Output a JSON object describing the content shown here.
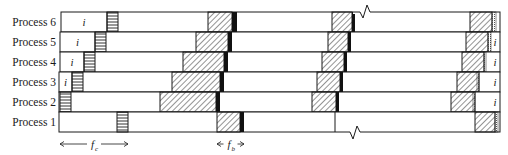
{
  "diagram": {
    "type": "process timeline (checkpoint / ladder diagram)",
    "rows": [
      {
        "label": "Process 6",
        "y": 12,
        "start": 61,
        "init_label": "i",
        "init_end": 107,
        "ladder": [
          107,
          118
        ],
        "phases": [
          {
            "hatch": [
              208,
              232
            ],
            "black": [
              232,
              237
            ]
          },
          {
            "hatch": [
              332,
              352
            ],
            "black": [
              352,
              355
            ]
          },
          {
            "hatch": [
              470,
              492
            ],
            "dotted": [
              492,
              496
            ]
          }
        ],
        "end": 500,
        "break_mark_top": 365,
        "tail_label": ""
      },
      {
        "label": "Process 5",
        "y": 32,
        "start": 60,
        "init_label": "i",
        "init_end": 95,
        "ladder": [
          95,
          106
        ],
        "phases": [
          {
            "hatch": [
              196,
              228
            ],
            "black": [
              228,
              232
            ]
          },
          {
            "hatch": [
              328,
              348
            ],
            "black": [
              348,
              351
            ]
          },
          {
            "hatch": [
              466,
              488
            ],
            "dotted": [
              488,
              491
            ]
          }
        ],
        "end": 500,
        "tail_label": "i"
      },
      {
        "label": "Process 4",
        "y": 52,
        "start": 60,
        "init_label": "i",
        "init_end": 84,
        "ladder": [
          84,
          95
        ],
        "phases": [
          {
            "hatch": [
              183,
              224
            ],
            "black": [
              224,
              228
            ]
          },
          {
            "hatch": [
              322,
              344
            ],
            "black": [
              344,
              347
            ]
          },
          {
            "hatch": [
              462,
              484
            ],
            "dotted": [
              484,
              486
            ]
          }
        ],
        "end": 500,
        "tail_label": "i"
      },
      {
        "label": "Process 3",
        "y": 72,
        "start": 59,
        "init_label": "i",
        "init_end": 72,
        "ladder": [
          72,
          83
        ],
        "phases": [
          {
            "hatch": [
              172,
              220
            ],
            "black": [
              220,
              224
            ]
          },
          {
            "hatch": [
              317,
              340
            ],
            "black": [
              340,
              343
            ]
          },
          {
            "hatch": [
              457,
              479
            ],
            "dotted": [
              477,
              479
            ]
          }
        ],
        "end": 500,
        "tail_label": "i"
      },
      {
        "label": "Process 2",
        "y": 92,
        "start": 59,
        "init_label": "",
        "init_end": 60,
        "ladder": [
          60,
          71
        ],
        "phases": [
          {
            "hatch": [
              160,
              216
            ],
            "black": [
              216,
              220
            ]
          },
          {
            "hatch": [
              312,
              336
            ],
            "black": [
              336,
              339
            ]
          },
          {
            "hatch": [
              451,
              475
            ],
            "dotted": [
              473,
              475
            ]
          }
        ],
        "end": 500,
        "tail_label": "i"
      },
      {
        "label": "Process 1",
        "y": 112,
        "start": 59,
        "init_label": "",
        "init_end": 59,
        "ladder": [
          117,
          128
        ],
        "phases": [
          {
            "hatch": [
              217,
              240
            ],
            "black": [
              240,
              244
            ]
          },
          {
            "divider": 335
          },
          {
            "hatch": [
              475,
              495
            ],
            "dotted": [
              495,
              498
            ]
          }
        ],
        "end": 500,
        "break_mark_bottom": 355,
        "tail_label": ""
      }
    ],
    "row_height": 20,
    "annotations": [
      {
        "symbol": "f",
        "subscript": "c",
        "x1": 60,
        "x2": 128,
        "y": 144
      },
      {
        "symbol": "f",
        "subscript": "b",
        "x1": 217,
        "x2": 244,
        "y": 144
      }
    ],
    "colors": {
      "line": "#1a1a1a",
      "hatch": "#2a2a2a",
      "fill": "#ffffff",
      "black": "#111111"
    }
  }
}
